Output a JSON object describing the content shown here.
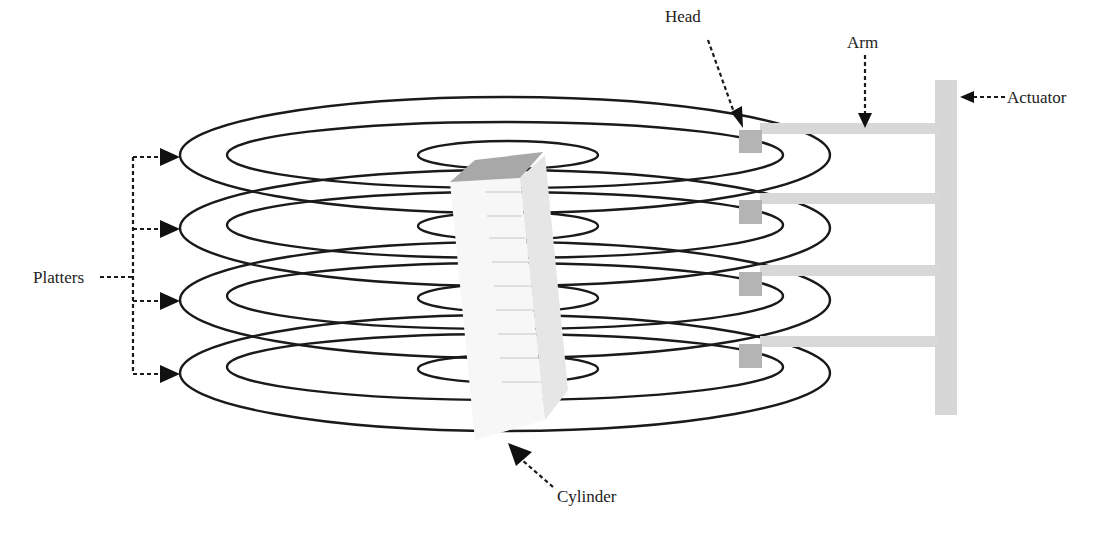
{
  "diagram": {
    "labels": {
      "head": "Head",
      "arm": "Arm",
      "actuator": "Actuator",
      "platters": "Platters",
      "cylinder": "Cylinder"
    },
    "platter_count": 4,
    "head_count": 4,
    "colors": {
      "stroke": "#1a1a1a",
      "arm": "#d8d8d8",
      "head": "#b4b4b4",
      "actuator": "#d6d6d6",
      "cylinder_top": "#a8a8a8",
      "cylinder_side": "#e6e6e6"
    }
  }
}
